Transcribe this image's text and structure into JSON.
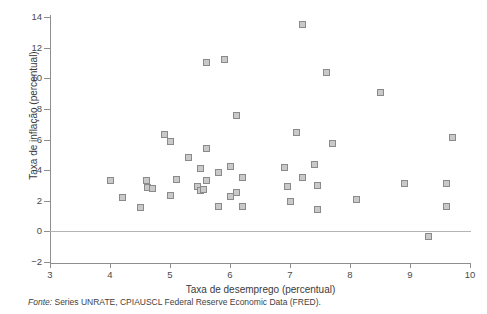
{
  "figure": {
    "source_note_label": "Fonte:",
    "source_note_text": " Series UNRATE, CPIAUSCL Federal Reserve Economic Data (FRED)."
  },
  "chart_data": {
    "type": "scatter",
    "title": "",
    "xlabel": "Taxa de desemprego (percentual)",
    "ylabel": "Taxa de inflação (percentual)",
    "xlim": [
      3,
      10
    ],
    "ylim": [
      -2,
      14
    ],
    "xticks": [
      3,
      4,
      5,
      6,
      7,
      8,
      9,
      10
    ],
    "yticks": [
      -2,
      0,
      2,
      4,
      6,
      8,
      10,
      12,
      14
    ],
    "grid": false,
    "legend": null,
    "marker_face_color": "#c9c9c9",
    "marker_edge_color": "#8a8a8a",
    "marker_shape": "square",
    "zero_line": 0,
    "points": [
      {
        "x": 4.0,
        "y": 3.35
      },
      {
        "x": 4.2,
        "y": 2.2
      },
      {
        "x": 4.5,
        "y": 1.55
      },
      {
        "x": 4.6,
        "y": 3.3
      },
      {
        "x": 4.62,
        "y": 2.85
      },
      {
        "x": 4.7,
        "y": 2.8
      },
      {
        "x": 4.9,
        "y": 6.3
      },
      {
        "x": 5.0,
        "y": 5.9
      },
      {
        "x": 5.0,
        "y": 2.35
      },
      {
        "x": 5.1,
        "y": 3.4
      },
      {
        "x": 5.3,
        "y": 4.8
      },
      {
        "x": 5.45,
        "y": 2.9
      },
      {
        "x": 5.5,
        "y": 4.1
      },
      {
        "x": 5.5,
        "y": 2.65
      },
      {
        "x": 5.55,
        "y": 2.75
      },
      {
        "x": 5.6,
        "y": 11.0
      },
      {
        "x": 5.6,
        "y": 5.4
      },
      {
        "x": 5.6,
        "y": 3.3
      },
      {
        "x": 5.8,
        "y": 3.85
      },
      {
        "x": 5.8,
        "y": 1.6
      },
      {
        "x": 5.9,
        "y": 11.2
      },
      {
        "x": 6.0,
        "y": 4.25
      },
      {
        "x": 6.0,
        "y": 2.3
      },
      {
        "x": 6.1,
        "y": 7.6
      },
      {
        "x": 6.1,
        "y": 2.55
      },
      {
        "x": 6.2,
        "y": 3.55
      },
      {
        "x": 6.2,
        "y": 1.6
      },
      {
        "x": 6.9,
        "y": 4.2
      },
      {
        "x": 6.95,
        "y": 2.95
      },
      {
        "x": 7.0,
        "y": 1.95
      },
      {
        "x": 7.1,
        "y": 6.45
      },
      {
        "x": 7.2,
        "y": 13.5
      },
      {
        "x": 7.2,
        "y": 3.5
      },
      {
        "x": 7.4,
        "y": 4.35
      },
      {
        "x": 7.45,
        "y": 3.0
      },
      {
        "x": 7.45,
        "y": 1.45
      },
      {
        "x": 7.6,
        "y": 10.35
      },
      {
        "x": 7.7,
        "y": 5.75
      },
      {
        "x": 8.1,
        "y": 2.05
      },
      {
        "x": 8.5,
        "y": 9.1
      },
      {
        "x": 8.9,
        "y": 3.1
      },
      {
        "x": 9.3,
        "y": -0.35
      },
      {
        "x": 9.6,
        "y": 3.1
      },
      {
        "x": 9.6,
        "y": 1.6
      },
      {
        "x": 9.7,
        "y": 6.1
      }
    ]
  }
}
